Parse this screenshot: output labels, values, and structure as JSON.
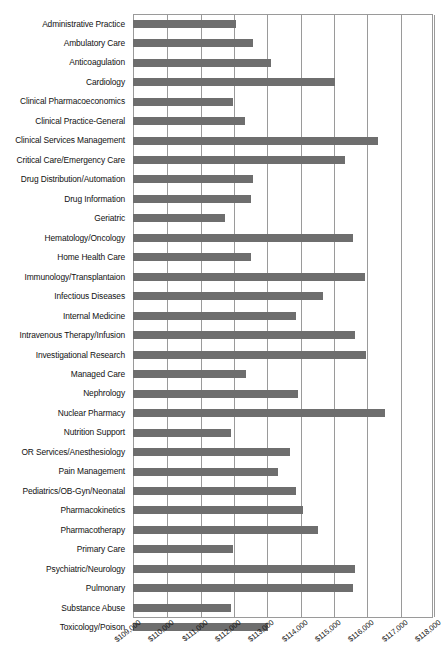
{
  "chart_data": {
    "type": "bar",
    "orientation": "horizontal",
    "title": "",
    "xlabel": "",
    "ylabel": "",
    "xlim": [
      109000,
      118000
    ],
    "xticks": [
      "$109,000",
      "$110,000",
      "$111,000",
      "$112,000",
      "$113,000",
      "$114,000",
      "$115,000",
      "$116,000",
      "$117,000",
      "$118,000"
    ],
    "xtick_values": [
      109000,
      110000,
      111000,
      112000,
      113000,
      114000,
      115000,
      116000,
      117000,
      118000
    ],
    "grid": true,
    "legend": "none",
    "bar_color": "#6e6e6e",
    "axis_color": "#9a9a9a",
    "categories": [
      "Administrative Practice",
      "Ambulatory Care",
      "Anticoagulation",
      "Cardiology",
      "Clinical Pharmacoeconomics",
      "Clinical Practice-General",
      "Clinical Services Management",
      "Critical Care/Emergency Care",
      "Drug Distribution/Automation",
      "Drug Information",
      "Geriatric",
      "Hematology/Oncology",
      "Home Health Care",
      "Immunology/Transplantaion",
      "Infectious Diseases",
      "Internal Medicine",
      "Intravenous Therapy/Infusion",
      "Investigational Research",
      "Managed Care",
      "Nephrology",
      "Nuclear Pharmacy",
      "Nutrition Support",
      "OR Services/Anesthesiology",
      "Pain Management",
      "Pediatrics/OB-Gyn/Neonatal",
      "Pharmacokinetics",
      "Pharmacotherapy",
      "Primary Care",
      "Psychiatric/Neurology",
      "Pulmonary",
      "Substance Abuse",
      "Toxicology/Poison"
    ],
    "values": [
      112100,
      112600,
      113150,
      115050,
      112000,
      112350,
      116350,
      115350,
      112600,
      112550,
      111750,
      115600,
      112550,
      115950,
      114700,
      113900,
      115650,
      116000,
      112400,
      113950,
      116550,
      111950,
      113700,
      113350,
      113900,
      114100,
      114550,
      112000,
      115650,
      115600,
      111950,
      113050
    ]
  }
}
